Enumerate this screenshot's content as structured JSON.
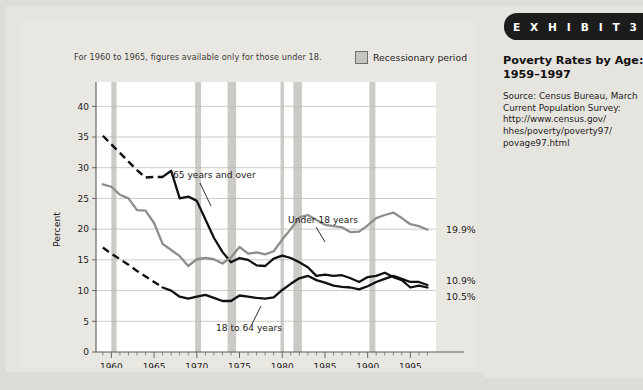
{
  "exhibit": {
    "banner_label": "E X H I B I T   3",
    "title_line1": "Poverty Rates by Age:",
    "title_line2": "1959–1997",
    "source": "Source: Census Bureau, March Current Population Survey: http://www.census.gov/ hhes/poverty/poverty97/ povage97.html"
  },
  "figure": {
    "footnote": "For 1960 to 1965, figures available only for those under 18.",
    "legend_label": "Recessionary period",
    "legend_swatch_color": "#c6c5c2"
  },
  "annotations": {
    "over65": "65 years and over",
    "under18": "Under 18 years",
    "adults": "18 to 64 years"
  },
  "end_labels": {
    "under18": "19.9%",
    "over65": "10.9%",
    "adults": "10.5%"
  },
  "chart_data": {
    "type": "line",
    "title": "Poverty Rates by Age: 1959–1997",
    "xlabel": "",
    "ylabel": "Percent",
    "xlim": [
      1958.2,
      1998.0
    ],
    "ylim": [
      0,
      42
    ],
    "yticks": [
      0,
      5,
      10,
      15,
      20,
      25,
      30,
      35,
      40
    ],
    "xticks": [
      1960,
      1965,
      1970,
      1975,
      1980,
      1985,
      1990,
      1995
    ],
    "xtick_minor_step": 1,
    "grid": "horizontal",
    "legend": "inline-annotations",
    "colors": {
      "dark": "#111111",
      "grey": "#8e8d8a",
      "recession": "#c8c7c3"
    },
    "series": [
      {
        "name": "65 years and over",
        "color": "#111111",
        "style": "dashed-then-solid",
        "dashed_range": [
          1959,
          1966
        ],
        "x": [
          1959,
          1960,
          1961,
          1962,
          1963,
          1964,
          1965,
          1966,
          1967,
          1968,
          1969,
          1970,
          1971,
          1972,
          1973,
          1974,
          1975,
          1976,
          1977,
          1978,
          1979,
          1980,
          1981,
          1982,
          1983,
          1984,
          1985,
          1986,
          1987,
          1988,
          1989,
          1990,
          1991,
          1992,
          1993,
          1994,
          1995,
          1996,
          1997
        ],
        "y": [
          35.2,
          33.8,
          32.4,
          31.0,
          29.6,
          28.4,
          28.5,
          28.5,
          29.5,
          25.0,
          25.3,
          24.6,
          21.6,
          18.6,
          16.3,
          14.6,
          15.3,
          15.0,
          14.1,
          14.0,
          15.2,
          15.7,
          15.3,
          14.6,
          13.8,
          12.4,
          12.6,
          12.4,
          12.5,
          12.0,
          11.4,
          12.2,
          12.4,
          12.9,
          12.2,
          11.7,
          10.5,
          10.8,
          10.5
        ],
        "end_value": 10.9
      },
      {
        "name": "Under 18 years",
        "color": "#8e8d8a",
        "style": "solid",
        "x": [
          1959,
          1960,
          1961,
          1962,
          1963,
          1964,
          1965,
          1966,
          1967,
          1968,
          1969,
          1970,
          1971,
          1972,
          1973,
          1974,
          1975,
          1976,
          1977,
          1978,
          1979,
          1980,
          1981,
          1982,
          1983,
          1984,
          1985,
          1986,
          1987,
          1988,
          1989,
          1990,
          1991,
          1992,
          1993,
          1994,
          1995,
          1996,
          1997
        ],
        "y": [
          27.3,
          26.9,
          25.6,
          25.0,
          23.1,
          23.0,
          21.0,
          17.6,
          16.6,
          15.6,
          14.0,
          15.1,
          15.3,
          15.1,
          14.4,
          15.4,
          17.1,
          16.0,
          16.2,
          15.9,
          16.4,
          18.3,
          20.0,
          21.9,
          22.3,
          21.5,
          20.7,
          20.5,
          20.3,
          19.5,
          19.6,
          20.6,
          21.8,
          22.3,
          22.7,
          21.8,
          20.8,
          20.5,
          19.9
        ],
        "end_value": 19.9
      },
      {
        "name": "18 to 64 years",
        "color": "#111111",
        "style": "dashed-then-solid",
        "dashed_range": [
          1959,
          1966
        ],
        "x": [
          1959,
          1960,
          1961,
          1962,
          1963,
          1964,
          1965,
          1966,
          1967,
          1968,
          1969,
          1970,
          1971,
          1972,
          1973,
          1974,
          1975,
          1976,
          1977,
          1978,
          1979,
          1980,
          1981,
          1982,
          1983,
          1984,
          1985,
          1986,
          1987,
          1988,
          1989,
          1990,
          1991,
          1992,
          1993,
          1994,
          1995,
          1996,
          1997
        ],
        "y": [
          17.0,
          16.0,
          15.1,
          14.2,
          13.2,
          12.3,
          11.4,
          10.5,
          10.0,
          9.0,
          8.7,
          9.0,
          9.3,
          8.8,
          8.3,
          8.3,
          9.2,
          9.0,
          8.8,
          8.7,
          8.9,
          10.1,
          11.1,
          12.0,
          12.4,
          11.7,
          11.3,
          10.8,
          10.6,
          10.5,
          10.2,
          10.7,
          11.4,
          11.9,
          12.4,
          11.9,
          11.4,
          11.4,
          10.9
        ],
        "end_value": 10.9
      }
    ],
    "recession_bands": [
      {
        "start": 1960.0,
        "end": 1960.6
      },
      {
        "start": 1969.8,
        "end": 1970.5
      },
      {
        "start": 1973.6,
        "end": 1974.6
      },
      {
        "start": 1979.8,
        "end": 1980.2
      },
      {
        "start": 1981.3,
        "end": 1982.3
      },
      {
        "start": 1990.2,
        "end": 1990.9
      }
    ]
  }
}
